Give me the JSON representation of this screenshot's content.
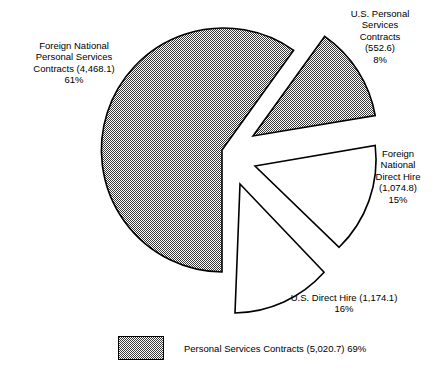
{
  "chart_data": {
    "type": "pie",
    "title": "",
    "subtitle": "",
    "xlabel": "",
    "ylabel": "",
    "grid": false,
    "legend_position": "bottom-left",
    "units": "millions of dollars",
    "categories": [
      "Foreign National Personal Services Contracts",
      "U.S. Personal Services Contracts",
      "Foreign National Direct Hire",
      "U.S. Direct Hire"
    ],
    "values": [
      4468.1,
      552.6,
      1074.8,
      1174.1
    ],
    "percentages": [
      61,
      8,
      15,
      16
    ],
    "slices": [
      {
        "name": "Foreign National Personal Services Contracts",
        "value": 4468.1,
        "value_text": "4,468.1",
        "percent": 61,
        "percent_text": "61%",
        "fill": "hatched",
        "exploded": false,
        "label_lines": "Foreign National\nPersonal Services\nContracts (4,468.1)\n61%"
      },
      {
        "name": "U.S. Personal Services Contracts",
        "value": 552.6,
        "value_text": "552.6",
        "percent": 8,
        "percent_text": "8%",
        "fill": "hatched",
        "exploded": true,
        "label_lines": "U.S. Personal\nServices\nContracts\n(552.6)\n8%"
      },
      {
        "name": "Foreign National Direct Hire",
        "value": 1074.8,
        "value_text": "1,074.8",
        "percent": 15,
        "percent_text": "15%",
        "fill": "white",
        "exploded": true,
        "label_lines": "Foreign\nNational\nDirect Hire\n(1,074.8)\n15%"
      },
      {
        "name": "U.S. Direct Hire",
        "value": 1174.1,
        "value_text": "1,174.1",
        "percent": 16,
        "percent_text": "16%",
        "fill": "white",
        "exploded": true,
        "label_lines": "U.S. Direct Hire (1,174.1)\n16%"
      }
    ],
    "legend": [
      {
        "label": "Personal Services Contracts (5,020.7) 69%",
        "value": 5020.7,
        "value_text": "5,020.7",
        "percent": 69,
        "percent_text": "69%",
        "swatch": "hatched"
      }
    ],
    "colors": {
      "outline": "#000000",
      "hatch_fill": "#808080",
      "background": "#ffffff"
    }
  }
}
